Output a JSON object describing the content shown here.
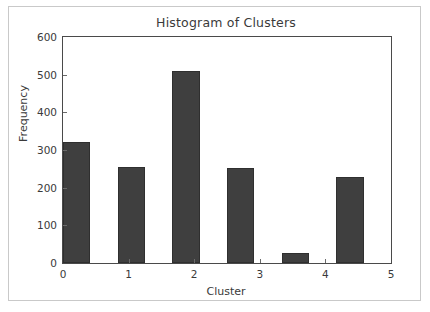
{
  "chart_data": {
    "type": "bar",
    "title": "Histogram of Clusters",
    "xlabel": "Cluster",
    "ylabel": "Frequency",
    "categories": [
      "0",
      "1",
      "2",
      "3",
      "4",
      "5"
    ],
    "values": [
      321,
      255,
      510,
      252,
      27,
      228
    ],
    "xtick_labels": [
      "0",
      "1",
      "2",
      "3",
      "4",
      "5"
    ],
    "ytick_labels": [
      "0",
      "100",
      "200",
      "300",
      "400",
      "500",
      "600"
    ],
    "ytick_values": [
      0,
      100,
      200,
      300,
      400,
      500,
      600
    ],
    "xlim": [
      0,
      5
    ],
    "ylim": [
      0,
      600
    ],
    "grid": false,
    "legend": null,
    "bar_color": "#3f3f3f",
    "bar_edge_color": "#2f2f2f",
    "axes_color": "#4a4a4a",
    "text_color": "#3a3a3a",
    "background_color": "#ffffff",
    "frame_color": "#c9c9c9",
    "bar_width_fraction": 0.5,
    "bar_align": "left"
  }
}
